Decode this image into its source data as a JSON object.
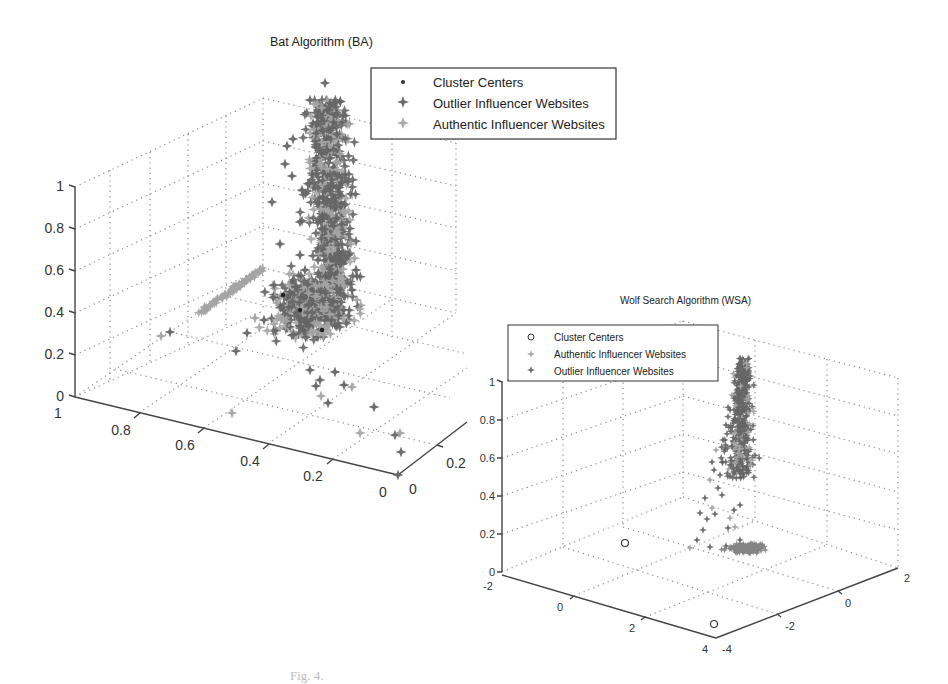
{
  "figure": {
    "caption": "Fig. 4."
  },
  "chart_data": [
    {
      "type": "scatter",
      "dimension": "3d",
      "title": "Bat Algorithm (BA)",
      "axes": {
        "x": {
          "ticks": [
            "1",
            "0.8",
            "0.6",
            "0.4",
            "0.2",
            "0"
          ],
          "range": [
            0,
            1
          ]
        },
        "y": {
          "ticks": [
            "0",
            "0.2"
          ],
          "range": [
            0,
            0.3
          ]
        },
        "z": {
          "ticks": [
            "0",
            "0.2",
            "0.4",
            "0.6",
            "0.8",
            "1"
          ],
          "range": [
            0,
            1
          ]
        }
      },
      "grid": true,
      "legend": {
        "position": "upper right",
        "entries": [
          {
            "label": "Cluster Centers",
            "marker": "dot",
            "color": "#333333"
          },
          {
            "label": "Outlier Influencer Websites",
            "marker": "star",
            "color": "#6a6a6a"
          },
          {
            "label": "Authentic Influencer Websites",
            "marker": "star",
            "color": "#a8a8a8"
          }
        ]
      },
      "series": [
        {
          "name": "Outlier Influencer Websites",
          "description": "tall vertical cluster near x≈0.1, z 0.5–1.0 plus scattered points"
        },
        {
          "name": "Authentic Influencer Websites",
          "description": "dense blob near x≈0.15, z≈0.3–0.45; diagonal line from x≈0.9 to 0.5 at z≈0.3–0.5"
        },
        {
          "name": "Cluster Centers",
          "description": "a few dark dots inside lower cluster"
        }
      ]
    },
    {
      "type": "scatter",
      "dimension": "3d",
      "title": "Wolf Search Algorithm (WSA)",
      "axes": {
        "x": {
          "ticks": [
            "-2",
            "0",
            "2",
            "4"
          ],
          "range": [
            -2,
            4
          ]
        },
        "y": {
          "ticks": [
            "-4",
            "-2",
            "0",
            "2"
          ],
          "range": [
            -4,
            2
          ]
        },
        "z": {
          "ticks": [
            "0",
            "0.2",
            "0.4",
            "0.6",
            "0.8",
            "1"
          ],
          "range": [
            0,
            1
          ]
        }
      },
      "grid": true,
      "legend": {
        "position": "upper left",
        "entries": [
          {
            "label": "Cluster Centers",
            "marker": "circle",
            "color": "#333333"
          },
          {
            "label": "Authentic Influencer Websites",
            "marker": "star",
            "color": "#a8a8a8"
          },
          {
            "label": "Outlier Influencer Websites",
            "marker": "star",
            "color": "#6a6a6a"
          }
        ]
      },
      "series": [
        {
          "name": "Outlier Influencer Websites",
          "description": "tall vertical column near back corner, z 0.3–1.0, with scattered points below"
        },
        {
          "name": "Authentic Influencer Websites",
          "description": "flat dense ellipse at z≈0.1 near the back corner"
        },
        {
          "name": "Cluster Centers",
          "description": "two open circles near front-left region (x≈2,y≈-4 and x≈4,y≈-4 at z≈0.15/0)"
        }
      ]
    }
  ]
}
